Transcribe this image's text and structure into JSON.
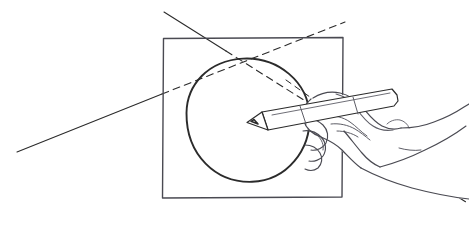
{
  "image": {
    "title": "Hand drawing a circle inscribed in a square",
    "medium": "pen-and-ink line drawing",
    "width": 469,
    "height": 225,
    "background_color": "#ffffff",
    "ink_color": "#2b2b2b",
    "secondary_ink_color": "#4a4a52"
  },
  "scene": {
    "square": {
      "name": "square-frame",
      "description": "Hand-drawn square outline",
      "left": 162,
      "top": 37,
      "right": 343,
      "bottom": 198,
      "stroke_color": "#4a4a52",
      "stroke_width": 1.4,
      "path": "M 163.5 38.5 L 343 37.5 L 342 197 L 162.5 198 Z"
    },
    "circle": {
      "name": "inscribed-circle",
      "description": "Circle inscribed in the square",
      "center_x": 247,
      "center_y": 120,
      "radius": 62,
      "stroke_color": "#2b2b2b",
      "stroke_width": 1.9,
      "path": "M 186.5 113 C 186.8 85 208 60.5 243 58.6 C 278 56.8 308.5 82 309.6 116 C 310.7 150 287 180.6 252 181.8 C 216 183 186.2 155 186.5 113 Z"
    },
    "construction_lines": [
      {
        "name": "diagonal-line-a",
        "description": "Construction line from upper-left to lower-right; solid outside the square, dashed inside",
        "style": "solid-then-dashed",
        "solid_segment": "M 164 12 L 226 51",
        "dashed_segment": "M 226 51 L 469 204",
        "stroke_color": "#2b2b2b",
        "stroke_width": 1.1,
        "dash_pattern": "7 5"
      },
      {
        "name": "diagonal-line-b",
        "description": "Construction line from lower-left to upper-right; solid outside the square, dashed inside",
        "style": "solid-then-dashed",
        "solid_segment": "M 17 152 L 162 94",
        "dashed_segment": "M 162 94 L 345 22",
        "stroke_color": "#2b2b2b",
        "stroke_width": 1.1,
        "dash_pattern": "7 5"
      },
      {
        "name": "diagonal-line-c",
        "description": "Short dashed ray from circle edge toward lower right past the wrist",
        "style": "dashed",
        "dashed_segment": "M 286 80 L 348 124",
        "stroke_color": "#3a3a42",
        "stroke_width": 1.0,
        "dash_pattern": "6 5"
      }
    ],
    "intersection_point": {
      "name": "construction-intersection",
      "description": "Point where the two construction lines cross, near the top of the circle",
      "x": 256,
      "y": 57
    },
    "pencil": {
      "name": "pencil",
      "description": "Pencil held in the hand, tip touching the circle center",
      "tip_x": 248,
      "tip_y": 122,
      "butt_x": 396,
      "butt_y": 96,
      "stroke_color": "#2b2b2b",
      "body_path": "M 262 112 L 392 89 L 397 95 L 398 101 L 394 106 L 268 130 Z",
      "tip_path": "M 262 112 L 268 130 L 247 122.5 Z",
      "lead_path": "M 254 119.5 L 251 121.3 L 258 124 Z",
      "ferrule_lines": [
        "M 300 106 L 306 124",
        "M 353 97 L 358 114"
      ]
    },
    "hand": {
      "name": "hand-holding-pencil",
      "description": "Right hand gripping the pencil, seen from above; wrist and forearm extend off the right edge",
      "stroke_color": "#4a4a52",
      "outline_path": "M 311 99 C 306 103 303 110 305 117 C 307 124 313 129 321 131 C 327 133 334 135 340 139 C 347 144 352 150 358 156 C 363 161 368 166 374 169 L 469 169 L 469 121 C 460 120 452 117 446 112 C 440 107 436 100 432 94 C 428 88 423 83 416 82 C 409 81 402 84 397 89 L 397 95",
      "index_finger_path": "M 316 101 C 322 97 330 95 338 96 C 347 97 354 101 360 107 C 366 113 371 120 378 124 C 384 128 391 129 398 128",
      "knuckle_paths": [
        "M 324 118 C 332 116 341 117 348 121 C 355 125 360 131 366 135",
        "M 330 126 C 338 124 347 125 354 129",
        "M 338 133 C 345 132 353 133 359 136"
      ],
      "thumb_path": "M 306 117 C 303 124 302 132 304 140 C 306 148 311 155 318 159 C 324 162 331 162 336 158",
      "curled_fingers_paths": [
        "M 305 124 C 311 122 318 123 323 127 C 328 131 330 138 328 144 C 326 150 320 154 314 154 C 308 154 303 150 301 144",
        "M 304 137 C 310 135 317 136 322 140 C 327 144 328 151 325 157 C 322 162 316 165 310 164",
        "M 307 150 C 312 149 318 151 321 155 C 324 159 324 165 321 169"
      ],
      "wrist_paths": [
        "M 374 169 C 386 176 400 182 415 187 C 430 192 446 196 462 199",
        "M 352 150 C 362 152 373 155 383 159"
      ],
      "forearm_path": "M 469 169 L 469 121",
      "nail_path": "M 391 126 C 394 123 398 121 403 121 C 408 121 412 124 414 128"
    }
  },
  "labels": {
    "none_visible": ""
  }
}
